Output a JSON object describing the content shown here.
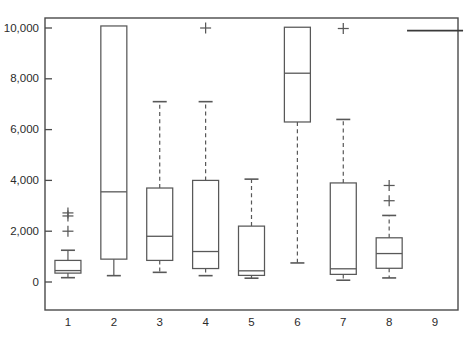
{
  "chart_data": {
    "type": "box",
    "title": "",
    "xlabel": "",
    "ylabel": "",
    "xlim": [
      0.4,
      9.6
    ],
    "ylim": [
      -1100,
      10700
    ],
    "grid": false,
    "legend": null,
    "categories": [
      "1",
      "2",
      "3",
      "4",
      "5",
      "6",
      "7",
      "8",
      "9"
    ],
    "y_ticks": [
      0,
      2000,
      4000,
      6000,
      8000,
      10000
    ],
    "y_tick_labels": [
      "0",
      "2,000",
      "4,000",
      "6,000",
      "8,000",
      "10,000"
    ],
    "x_tick_labels": [
      "1",
      "2",
      "3",
      "4",
      "5",
      "6",
      "7",
      "8",
      "9"
    ],
    "boxes": [
      {
        "category": "1",
        "whisker_low": 170,
        "q1": 350,
        "median": 450,
        "q3": 850,
        "whisker_high": 1250,
        "whisker_style": "solid",
        "outliers": [
          2000,
          2600,
          2720
        ],
        "truncated_high": false
      },
      {
        "category": "2",
        "whisker_low": 250,
        "q1": 900,
        "median": 3550,
        "q3": 10080,
        "whisker_high": 10080,
        "whisker_style": "solid",
        "outliers": [],
        "truncated_high": true
      },
      {
        "category": "3",
        "whisker_low": 380,
        "q1": 850,
        "median": 1800,
        "q3": 3700,
        "whisker_high": 7100,
        "whisker_style": "dashed",
        "outliers": [],
        "truncated_high": false
      },
      {
        "category": "4",
        "whisker_low": 250,
        "q1": 530,
        "median": 1200,
        "q3": 4000,
        "whisker_high": 7100,
        "whisker_style": "dashed",
        "outliers": [
          10000
        ],
        "truncated_high": false
      },
      {
        "category": "5",
        "whisker_low": 150,
        "q1": 260,
        "median": 440,
        "q3": 2200,
        "whisker_high": 4050,
        "whisker_style": "dashed",
        "outliers": [],
        "truncated_high": false
      },
      {
        "category": "6",
        "whisker_low": 750,
        "q1": 6300,
        "median": 8220,
        "q3": 10030,
        "whisker_high": 10030,
        "whisker_style": "dashed",
        "outliers": [],
        "truncated_high": true
      },
      {
        "category": "7",
        "whisker_low": 70,
        "q1": 300,
        "median": 520,
        "q3": 3900,
        "whisker_high": 6400,
        "whisker_style": "dashed",
        "outliers": [
          9980
        ],
        "truncated_high": false
      },
      {
        "category": "8",
        "whisker_low": 160,
        "q1": 540,
        "median": 1120,
        "q3": 1740,
        "whisker_high": 2620,
        "whisker_style": "dashed",
        "outliers": [
          3200,
          3800
        ],
        "truncated_high": false
      },
      {
        "category": "9",
        "whisker_low": 9900,
        "q1": 9900,
        "median": 9900,
        "q3": 9900,
        "whisker_high": 9900,
        "whisker_style": "none",
        "outliers": [],
        "truncated_high": false,
        "flat": true
      }
    ]
  },
  "axes": {
    "plot_left": 45,
    "plot_right": 458,
    "plot_top": 18,
    "plot_bottom": 310,
    "y_zero_px": 282,
    "y_top_value_px": 28
  },
  "colors": {
    "frame": "#4a4a4a",
    "box": "#585858",
    "text": "#2b2b2b",
    "background": "#ffffff"
  }
}
